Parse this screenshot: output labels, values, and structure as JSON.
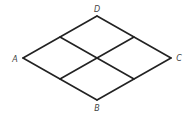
{
  "figure": {
    "type": "rhombus-grid",
    "stroke_color": "#222222",
    "label_color": "#444444",
    "vertices": {
      "D": {
        "x": 97,
        "y": 16
      },
      "A": {
        "x": 23,
        "y": 58
      },
      "C": {
        "x": 171,
        "y": 58
      },
      "B": {
        "x": 97,
        "y": 100
      }
    },
    "labels": [
      {
        "text": "D",
        "x": 97,
        "y": 9
      },
      {
        "text": "A",
        "x": 15,
        "y": 59
      },
      {
        "text": "C",
        "x": 179,
        "y": 58
      },
      {
        "text": "B",
        "x": 97,
        "y": 108
      }
    ],
    "midpoints": {
      "AD": {
        "x": 60,
        "y": 37
      },
      "DC": {
        "x": 134,
        "y": 37
      },
      "AB": {
        "x": 60,
        "y": 79
      },
      "BC": {
        "x": 134,
        "y": 79
      },
      "center": {
        "x": 97,
        "y": 58
      }
    }
  }
}
